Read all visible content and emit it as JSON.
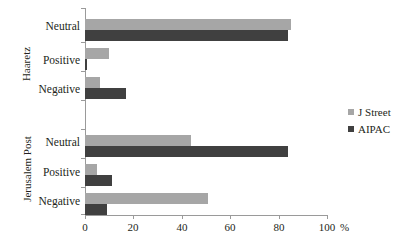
{
  "chart_data": {
    "type": "bar",
    "orientation": "horizontal",
    "title": "",
    "xlabel": "%",
    "ylabel": "",
    "xlim": [
      0,
      100
    ],
    "xticks": [
      "0",
      "20",
      "40",
      "60",
      "80",
      "100"
    ],
    "grid": false,
    "legend_position": "right",
    "series": [
      {
        "name": "J Street",
        "color": "#a6a6a6",
        "values": [
          85,
          10,
          6,
          44,
          5,
          51
        ]
      },
      {
        "name": "AIPAC",
        "color": "#404040",
        "values": [
          84,
          1,
          17,
          84,
          11,
          9
        ]
      }
    ],
    "groups": [
      {
        "label": "Haaretz",
        "categories": [
          "Neutral",
          "Positive",
          "Negative"
        ],
        "data": [
          {
            "category": "Neutral",
            "J Street": 85,
            "AIPAC": 84
          },
          {
            "category": "Positive",
            "J Street": 10,
            "AIPAC": 1
          },
          {
            "category": "Negative",
            "J Street": 6,
            "AIPAC": 17
          }
        ]
      },
      {
        "label": "Jerusalem Post",
        "categories": [
          "Neutral",
          "Positive",
          "Negative"
        ],
        "data": [
          {
            "category": "Neutral",
            "J Street": 44,
            "AIPAC": 84
          },
          {
            "category": "Positive",
            "J Street": 5,
            "AIPAC": 11
          },
          {
            "category": "Negative",
            "J Street": 51,
            "AIPAC": 9
          }
        ]
      }
    ],
    "categories": [
      "Haaretz Neutral",
      "Haaretz Positive",
      "Haaretz Negative",
      "Jerusalem Post Neutral",
      "Jerusalem Post Positive",
      "Jerusalem Post Negative"
    ]
  },
  "axis": {
    "x_unit": "%",
    "ticks": [
      "0",
      "20",
      "40",
      "60",
      "80",
      "100"
    ]
  },
  "legend": {
    "items": [
      {
        "label": "J Street",
        "color": "#a6a6a6"
      },
      {
        "label": "AIPAC",
        "color": "#404040"
      }
    ]
  },
  "labels": {
    "group_haaretz": "Haaretz",
    "group_jpost": "Jerusalem Post",
    "cat_neutral": "Neutral",
    "cat_positive": "Positive",
    "cat_negative": "Negative"
  }
}
